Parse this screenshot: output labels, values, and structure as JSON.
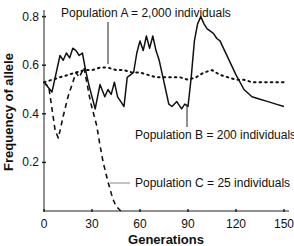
{
  "chart_data": {
    "type": "line",
    "title": "",
    "xlabel": "Generations",
    "ylabel": "Frequency of allele",
    "xlim": [
      0,
      150
    ],
    "ylim": [
      0,
      0.85
    ],
    "xticks": [
      0,
      30,
      60,
      90,
      120,
      150
    ],
    "xtick_labels": [
      "0",
      "30",
      "60",
      "90",
      "120",
      "150"
    ],
    "yticks": [
      0.2,
      0.4,
      0.6,
      0.8
    ],
    "ytick_labels": [
      "0.2",
      "0.4",
      "0.6",
      "0.8"
    ],
    "grid": false,
    "legend": "inline annotations",
    "series": [
      {
        "name": "Population A = 2,000 individuals",
        "style": "dotted",
        "x": [
          0,
          5,
          10,
          15,
          20,
          25,
          30,
          35,
          40,
          45,
          50,
          55,
          60,
          65,
          70,
          75,
          80,
          85,
          90,
          95,
          100,
          105,
          110,
          115,
          120,
          125,
          130,
          135,
          140,
          145,
          150
        ],
        "y": [
          0.53,
          0.54,
          0.55,
          0.56,
          0.57,
          0.58,
          0.58,
          0.59,
          0.59,
          0.58,
          0.58,
          0.57,
          0.57,
          0.56,
          0.55,
          0.55,
          0.55,
          0.55,
          0.54,
          0.55,
          0.57,
          0.58,
          0.56,
          0.55,
          0.54,
          0.54,
          0.53,
          0.53,
          0.53,
          0.53,
          0.53
        ]
      },
      {
        "name": "Population B = 200 individuals",
        "style": "solid",
        "x": [
          0,
          5,
          10,
          12,
          14,
          16,
          18,
          20,
          22,
          24,
          26,
          28,
          30,
          32,
          35,
          38,
          40,
          42,
          44,
          46,
          48,
          50,
          52,
          54,
          56,
          58,
          60,
          62,
          64,
          66,
          68,
          70,
          72,
          74,
          76,
          78,
          80,
          83,
          86,
          88,
          90,
          92,
          94,
          96,
          98,
          100,
          102,
          104,
          106,
          108,
          110,
          115,
          120,
          125,
          130,
          135,
          140,
          145,
          150
        ],
        "y": [
          0.53,
          0.49,
          0.64,
          0.62,
          0.65,
          0.63,
          0.67,
          0.66,
          0.64,
          0.65,
          0.58,
          0.52,
          0.47,
          0.42,
          0.52,
          0.47,
          0.5,
          0.48,
          0.53,
          0.47,
          0.45,
          0.43,
          0.55,
          0.56,
          0.57,
          0.65,
          0.7,
          0.66,
          0.72,
          0.67,
          0.72,
          0.66,
          0.62,
          0.56,
          0.5,
          0.44,
          0.43,
          0.45,
          0.42,
          0.44,
          0.43,
          0.55,
          0.7,
          0.77,
          0.8,
          0.77,
          0.75,
          0.74,
          0.73,
          0.71,
          0.7,
          0.63,
          0.56,
          0.5,
          0.47,
          0.46,
          0.45,
          0.44,
          0.43
        ]
      },
      {
        "name": "Population C = 25 individuals",
        "style": "dashed",
        "x": [
          0,
          3,
          5,
          7,
          9,
          12,
          15,
          18,
          20,
          22,
          25,
          27,
          29,
          31,
          33,
          35,
          37,
          40,
          43,
          45,
          48
        ],
        "y": [
          0.53,
          0.51,
          0.42,
          0.33,
          0.3,
          0.39,
          0.47,
          0.53,
          0.57,
          0.55,
          0.59,
          0.52,
          0.45,
          0.4,
          0.35,
          0.27,
          0.2,
          0.12,
          0.05,
          0.02,
          0.0
        ]
      }
    ],
    "annotations": [
      {
        "text": "Population A = 2,000 individuals",
        "target_series": 0
      },
      {
        "text": "Population B = 200 individuals",
        "target_series": 1
      },
      {
        "text": "Population C = 25 individuals",
        "target_series": 2
      }
    ]
  }
}
